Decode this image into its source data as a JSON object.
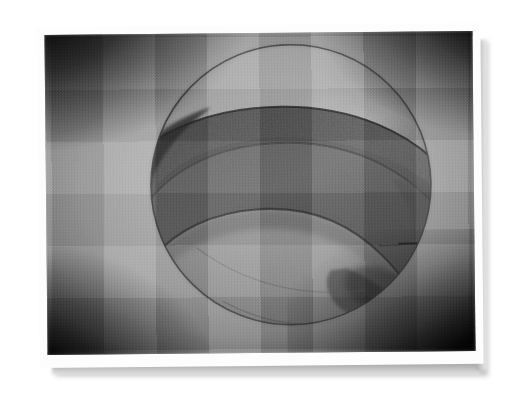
{
  "image": {
    "kind": "scanned-photograph",
    "subject": "graphite pencil drawing of a sphere encircled by a wide diagonal band",
    "palette": {
      "page_background": "#ffffff",
      "mount_border": "#fdfdfd",
      "drop_shadow": "#b9b9b9",
      "paper_midtone": "#ababab",
      "paper_highlight": "#c2c2c2",
      "vignette_dark": "#161616",
      "band_dark": "#4c4c4c",
      "band_darkest": "#2f2f2f",
      "outline_stroke": "#4a4a4a"
    },
    "photo_frame": {
      "left": 46,
      "top": 33,
      "width": 428,
      "height": 320,
      "rotation_deg": -0.55
    },
    "mount": {
      "left": 38,
      "top": 25,
      "width": 444,
      "height": 341
    }
  },
  "drawing": {
    "sphere": {
      "center_x": 245,
      "center_y": 152,
      "radius": 140,
      "outline_color": "#4a4a4a",
      "outline_width": 1.6
    },
    "band": {
      "description": "broad shaded ellipsoidal band crossing the sphere from upper-left to lower-right",
      "tilt_deg": -28,
      "fill_dark": "#4c4c4c",
      "fill_light": "#7a7a7a"
    },
    "highlight": {
      "description": "soft specular highlight on the upper-right of the sphere",
      "center_x": 320,
      "center_y": 95
    },
    "ground_shadow": {
      "description": "cast shadow pooled at lower-right of the sphere"
    }
  }
}
